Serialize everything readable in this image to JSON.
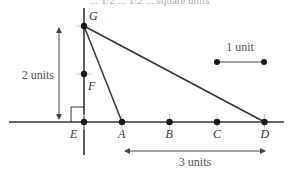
{
  "header_fragment": "... 1/2 ... 1/2 ... square units",
  "diagram": {
    "points": [
      {
        "id": "G",
        "label": "G",
        "x": 0,
        "y": 2
      },
      {
        "id": "F",
        "label": "F",
        "x": 0,
        "y": 1
      },
      {
        "id": "E",
        "label": "E",
        "x": 0,
        "y": 0
      },
      {
        "id": "A",
        "label": "A",
        "x": 0.8,
        "y": 0
      },
      {
        "id": "B",
        "label": "B",
        "x": 1.8,
        "y": 0
      },
      {
        "id": "C",
        "label": "C",
        "x": 2.8,
        "y": 0
      },
      {
        "id": "D",
        "label": "D",
        "x": 3.8,
        "y": 0
      }
    ],
    "segments": [
      {
        "from": "G",
        "to": "A"
      },
      {
        "from": "G",
        "to": "D"
      }
    ],
    "right_angle_at": "E",
    "dimension_labels": {
      "vertical": "2 units",
      "horizontal": "3 units",
      "scale": "1 unit"
    }
  },
  "colors": {
    "line": "#333333",
    "point": "#1a1a1a",
    "dimension": "#555555"
  }
}
